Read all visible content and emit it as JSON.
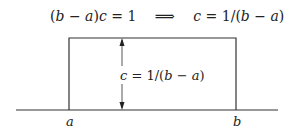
{
  "equation": {
    "lhs_paren": "(",
    "lhs_b": "b",
    "lhs_minus": " − ",
    "lhs_a": "a",
    "lhs_close": ")",
    "lhs_c": "c",
    "lhs_eq": " = 1",
    "implies": "⟹",
    "rhs_c": "c",
    "rhs_eq": " = 1/(",
    "rhs_b": "b",
    "rhs_minus": " − ",
    "rhs_a": "a",
    "rhs_close": ")"
  },
  "diagram": {
    "height_label": {
      "c": "c",
      "eq": " = 1/(",
      "b": "b",
      "minus": " − ",
      "a": "a",
      "close": ")"
    },
    "axis_labels": {
      "left": "a",
      "right": "b"
    },
    "colors": {
      "stroke": "#333333",
      "text": "#222222"
    }
  }
}
